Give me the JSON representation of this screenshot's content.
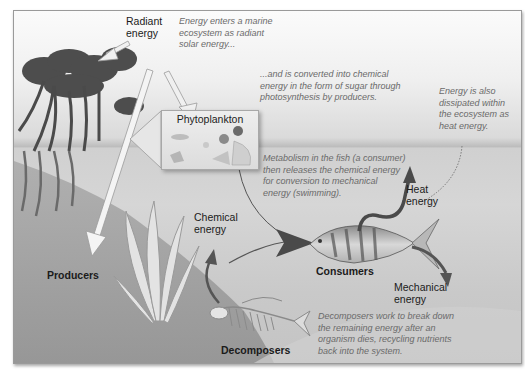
{
  "diagram": {
    "labels": {
      "radiant_energy": [
        "Radiant",
        "energy"
      ],
      "phytoplankton": "Phytoplankton",
      "producers": "Producers",
      "chemical_energy": [
        "Chemical",
        "energy"
      ],
      "consumers": "Consumers",
      "heat_energy": [
        "Heat",
        "energy"
      ],
      "mechanical_energy": [
        "Mechanical",
        "energy"
      ],
      "decomposers": "Decomposers"
    },
    "notes": {
      "solar": [
        "Energy enters a marine",
        "ecosystem as radiant",
        "solar energy..."
      ],
      "photosynthesis": [
        "...and is converted into chemical",
        "energy in the form of sugar through",
        "photosynthesis by producers."
      ],
      "heat": [
        "Energy is also",
        "dissipated within",
        "the ecosystem as",
        "heat energy."
      ],
      "metabolism": [
        "Metabolism in the fish (a consumer)",
        "then releases the chemical energy",
        "for conversion to mechanical",
        "energy (swimming)."
      ],
      "decomposers": [
        "Decomposers work to break down",
        "the remaining energy after an",
        "organism dies, recycling nutrients",
        "back into the system."
      ]
    },
    "colors": {
      "arrow_light": "#f2f2f2",
      "arrow_dark": "#4a4a4a",
      "note_text": "#6a6a6a",
      "label_text": "#1b1b1b"
    }
  }
}
